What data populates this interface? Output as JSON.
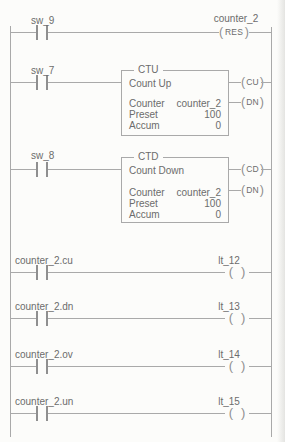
{
  "colors": {
    "background": "#fcfcfa",
    "line": "#a9a9a9",
    "line_dark": "#8f8f8f",
    "text": "#6c6c6c"
  },
  "rungs": [
    {
      "contact_label": "sw_9",
      "reset_coil": {
        "tag": "counter_2",
        "mnemonic": "RES"
      }
    },
    {
      "contact_label": "sw_7",
      "block": {
        "title": "CTU",
        "description": "Count Up",
        "params": [
          {
            "name": "Counter",
            "value": "counter_2"
          },
          {
            "name": "Preset",
            "value": "100"
          },
          {
            "name": "Accum",
            "value": "0"
          }
        ],
        "flags": [
          {
            "mnemonic": "CU"
          },
          {
            "mnemonic": "DN"
          }
        ]
      }
    },
    {
      "contact_label": "sw_8",
      "block": {
        "title": "CTD",
        "description": "Count Down",
        "params": [
          {
            "name": "Counter",
            "value": "counter_2"
          },
          {
            "name": "Preset",
            "value": "100"
          },
          {
            "name": "Accum",
            "value": "0"
          }
        ],
        "flags": [
          {
            "mnemonic": "CD"
          },
          {
            "mnemonic": "DN"
          }
        ]
      }
    },
    {
      "contact_label": "counter_2.cu",
      "coil_label": "lt_12"
    },
    {
      "contact_label": "counter_2.dn",
      "coil_label": "lt_13"
    },
    {
      "contact_label": "counter_2.ov",
      "coil_label": "lt_14"
    },
    {
      "contact_label": "counter_2.un",
      "coil_label": "lt_15"
    }
  ]
}
